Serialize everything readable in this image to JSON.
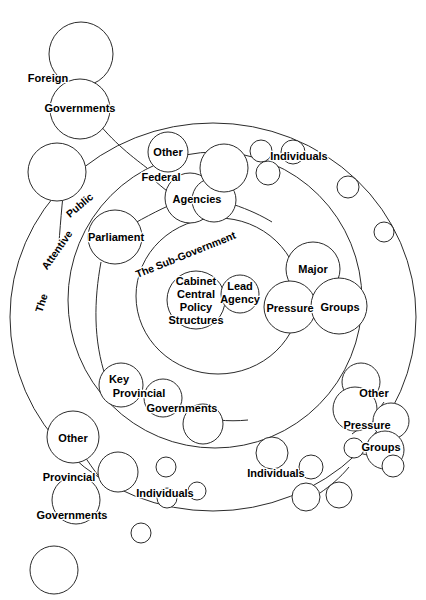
{
  "figure": {
    "stroke_color": "#2b2b2b",
    "fill_color": "#ffffff",
    "text_color": "#000000",
    "width": 426,
    "height": 600
  },
  "rings": [
    {
      "name": "outer-ring",
      "label": "The Attentive Public",
      "cx": 213,
      "cy": 317,
      "rx": 203,
      "ry": 194
    },
    {
      "name": "middle-ring",
      "label": "",
      "cx": 215,
      "cy": 300,
      "rx": 147,
      "ry": 148
    },
    {
      "name": "inner-ring",
      "label": "The Sub-Government",
      "cx": 218,
      "cy": 296,
      "rx": 82,
      "ry": 78
    }
  ],
  "ring_labels": {
    "attentive_public": {
      "words": [
        "The",
        "Attentive",
        "Public"
      ],
      "full": "The Attentive Public"
    },
    "sub_government": {
      "full": "The Sub-Government"
    }
  },
  "clusters": [
    {
      "id": "foreign-governments",
      "label_lines": [
        "Foreign",
        "Governments"
      ],
      "full_label": "Foreign Governments",
      "zone": "outside"
    },
    {
      "id": "other-federal-agencies",
      "label_lines": [
        "Other",
        "Federal",
        "Agencies"
      ],
      "full_label": "Other Federal Agencies",
      "zone": "middle"
    },
    {
      "id": "parliament",
      "label_lines": [
        "Parliament"
      ],
      "full_label": "Parliament",
      "zone": "middle"
    },
    {
      "id": "cabinet-central-policy-structures",
      "label_lines": [
        "Cabinet",
        "Central",
        "Policy",
        "Structures"
      ],
      "full_label": "Cabinet Central Policy Structures",
      "zone": "inner"
    },
    {
      "id": "lead-agency",
      "label_lines": [
        "Lead",
        "Agency"
      ],
      "full_label": "Lead Agency",
      "zone": "inner"
    },
    {
      "id": "major-pressure-groups",
      "label_lines": [
        "Major",
        "Pressure",
        "Groups"
      ],
      "full_label": "Major Pressure Groups",
      "zone": "inner"
    },
    {
      "id": "key-provincial-governments",
      "label_lines": [
        "Key",
        "Provincial",
        "Governments"
      ],
      "full_label": "Key Provincial Governments",
      "zone": "middle"
    },
    {
      "id": "other-provincial-governments",
      "label_lines": [
        "Other",
        "Provincial",
        "Governments"
      ],
      "full_label": "Other Provincial Governments",
      "zone": "outside"
    },
    {
      "id": "other-pressure-groups",
      "label_lines": [
        "Other",
        "Pressure",
        "Groups"
      ],
      "full_label": "Other Pressure Groups",
      "zone": "outer"
    },
    {
      "id": "individuals-top",
      "label_lines": [
        "Individuals"
      ],
      "full_label": "Individuals",
      "zone": "outer"
    },
    {
      "id": "individuals-bottom-left",
      "label_lines": [
        "Individuals"
      ],
      "full_label": "Individuals",
      "zone": "outer"
    },
    {
      "id": "individuals-bottom-right",
      "label_lines": [
        "Individuals"
      ],
      "full_label": "Individuals",
      "zone": "outer"
    }
  ],
  "labels": {
    "foreign": "Foreign",
    "governments_1": "Governments",
    "other_federal": "Other",
    "federal": "Federal",
    "agencies": "Agencies",
    "individuals_top": "Individuals",
    "parliament": "Parliament",
    "sub_government": "The Sub-Government",
    "cabinet": "Cabinet",
    "central": "Central",
    "policy": "Policy",
    "structures": "Structures",
    "lead": "Lead",
    "agency": "Agency",
    "major": "Major",
    "pressure": "Pressure",
    "groups": "Groups",
    "key": "Key",
    "provincial_key": "Provincial",
    "governments_key": "Governments",
    "other_provincial": "Other",
    "provincial": "Provincial",
    "governments_prov": "Governments",
    "individuals_bl": "Individuals",
    "individuals_br": "Individuals",
    "other_pg": "Other",
    "pressure_pg": "Pressure",
    "groups_pg": "Groups",
    "ring_the": "The",
    "ring_attentive": "Attentive",
    "ring_public": "Public"
  }
}
